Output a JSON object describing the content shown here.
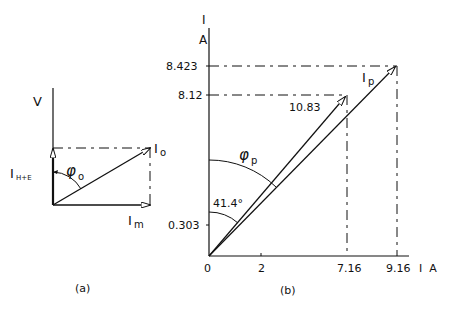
{
  "figure_a": {
    "caption": "(a)",
    "axis_label": "V",
    "vectors": {
      "io": "I",
      "io_sub": "o",
      "im": "I",
      "im_sub": "m",
      "ihe": "I",
      "ihe_sub": "H+E"
    },
    "angle": {
      "symbol": "φ",
      "sub": "o"
    }
  },
  "figure_b": {
    "caption": "(b)",
    "y_axis": {
      "label_top": "I",
      "label_unit": "A",
      "ticks": [
        "8.423",
        "8.12",
        "0.303"
      ]
    },
    "x_axis": {
      "label": "I  A",
      "ticks": [
        "0",
        "2",
        "7.16",
        "9.16"
      ]
    },
    "vectors": {
      "ip": "I",
      "ip_sub": "p",
      "magnitude": "10.83"
    },
    "angles": {
      "phi_symbol": "φ",
      "phi_sub": "p",
      "value": "41.4°"
    }
  }
}
